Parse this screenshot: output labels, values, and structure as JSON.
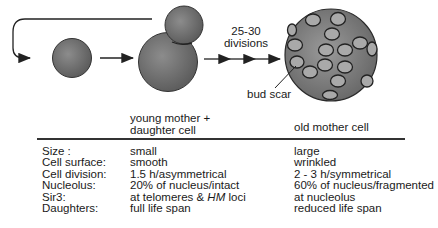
{
  "diagram": {
    "divisions_label_line1": "25-30",
    "divisions_label_line2": "divisions",
    "bud_scar_label": "bud scar",
    "young_header_line1": "young mother +",
    "young_header_line2": "daughter cell",
    "old_header": "old mother cell",
    "colors": {
      "cell_fill": "#7a7a7a",
      "cell_edge": "#2a2a2a",
      "scar_fill": "#a8a8a8",
      "line": "#222222"
    }
  },
  "table": {
    "rows": [
      {
        "property": "Size  :",
        "young": "small",
        "old": "large"
      },
      {
        "property": "Cell surface:",
        "young": "smooth",
        "old": "wrinkled"
      },
      {
        "property": "Cell division:",
        "young": "1.5 h/asymmetrical",
        "old": "2 - 3 h/symmetrical"
      },
      {
        "property": "Nucleolus:",
        "young": "20% of nucleus/intact",
        "old": "60% of nucleus/fragmented"
      },
      {
        "property": "Sir3:",
        "young_prefix": "at telomeres & ",
        "young_italic": "HM",
        "young_suffix": " loci",
        "old": "at nucleolus"
      },
      {
        "property": "Daughters:",
        "young": "full life span",
        "old": "reduced life span"
      }
    ]
  }
}
